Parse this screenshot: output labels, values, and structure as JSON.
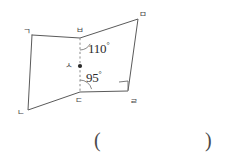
{
  "figure": {
    "type": "geometry-diagram",
    "stroke_color": "#5a5a5a",
    "dash_color": "#8a8a8a",
    "text_color": "#2b2b2b",
    "vertices": [
      {
        "name": "ㄱ",
        "label": "ㄱ",
        "x": 32,
        "y": 35,
        "label_x": 23,
        "label_y": 27
      },
      {
        "name": "ㅂ",
        "label": "ㅂ",
        "x": 80,
        "y": 38,
        "label_x": 76,
        "label_y": 26
      },
      {
        "name": "ㅁ",
        "label": "ㅁ",
        "x": 138,
        "y": 19,
        "label_x": 139,
        "label_y": 10
      },
      {
        "name": "ㄹ",
        "label": "ㄹ",
        "x": 128,
        "y": 91,
        "label_x": 130,
        "label_y": 97
      },
      {
        "name": "ㄷ",
        "label": "ㄷ",
        "x": 80,
        "y": 92,
        "label_x": 75,
        "label_y": 96
      },
      {
        "name": "ㄴ",
        "label": "ㄴ",
        "x": 28,
        "y": 110,
        "label_x": 17,
        "label_y": 108
      },
      {
        "name": "ㅅ",
        "label": "ㅅ",
        "x": 80,
        "y": 66,
        "label_x": 65,
        "label_y": 61
      }
    ],
    "angles": [
      {
        "name": "angle-at-B",
        "value": "110",
        "unit": "°",
        "x": 88,
        "y": 42
      },
      {
        "name": "angle-at-D",
        "value": "95",
        "unit": "°",
        "x": 86,
        "y": 71
      }
    ],
    "right_angle": {
      "name": "right-angle-mark-at-R",
      "x": 119,
      "y": 82,
      "size": 9
    },
    "answer_field": {
      "open_paren": "(",
      "close_paren": ")",
      "open_x": 94,
      "close_x": 205,
      "y": 130,
      "value": ""
    }
  }
}
